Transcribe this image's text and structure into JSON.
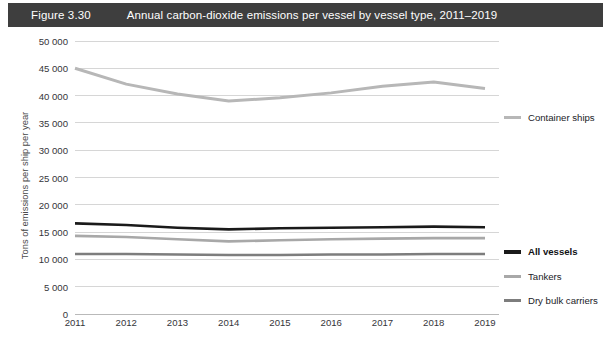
{
  "banner": {
    "figure_number": "Figure 3.30",
    "title": "Annual carbon-dioxide emissions per vessel by vessel type, 2011–2019",
    "background_color": "#3e3e3e",
    "text_color": "#ffffff"
  },
  "legend": {
    "position": "right",
    "entries": [
      {
        "label": "Container ships",
        "color": "#b7b7b7",
        "bold": false,
        "top": 84
      },
      {
        "label": "All vessels",
        "color": "#1a1a1a",
        "bold": true,
        "top": 218
      },
      {
        "label": "Tankers",
        "color": "#a8a8a8",
        "bold": false,
        "top": 243
      },
      {
        "label": "Dry bulk carriers",
        "color": "#7d7d7d",
        "bold": false,
        "top": 267
      }
    ]
  },
  "chart_data": {
    "type": "line",
    "title": "Annual carbon-dioxide emissions per vessel by vessel type, 2011–2019",
    "xlabel": "",
    "ylabel": "Tons of emissions per ship per year",
    "x": [
      "2011",
      "2012",
      "2013",
      "2014",
      "2015",
      "2016",
      "2017",
      "2018",
      "2019"
    ],
    "categories": [
      "2011",
      "2012",
      "2013",
      "2014",
      "2015",
      "2016",
      "2017",
      "2018",
      "2019"
    ],
    "ylim": [
      0,
      50000
    ],
    "yticks": [
      0,
      5000,
      10000,
      15000,
      20000,
      25000,
      30000,
      35000,
      40000,
      45000,
      50000
    ],
    "ytick_labels": [
      "0",
      "5 000",
      "10 000",
      "15 000",
      "20 000",
      "25 000",
      "30 000",
      "35 000",
      "40 000",
      "45 000",
      "50 000"
    ],
    "grid": true,
    "grid_axis": "y",
    "legend_position": "right",
    "series": [
      {
        "name": "Container ships",
        "color": "#b7b7b7",
        "width": 3.0,
        "values": [
          45000,
          42100,
          40300,
          39000,
          39600,
          40500,
          41700,
          42500,
          41300
        ]
      },
      {
        "name": "All vessels",
        "color": "#1a1a1a",
        "width": 2.6,
        "values": [
          16600,
          16300,
          15800,
          15500,
          15700,
          15800,
          15900,
          16000,
          15900
        ]
      },
      {
        "name": "Tankers",
        "color": "#a8a8a8",
        "width": 2.6,
        "values": [
          14300,
          14100,
          13700,
          13300,
          13500,
          13700,
          13800,
          13900,
          13900
        ]
      },
      {
        "name": "Dry bulk carriers",
        "color": "#7d7d7d",
        "width": 2.6,
        "values": [
          11000,
          11000,
          10900,
          10800,
          10800,
          10900,
          10900,
          11000,
          11000
        ]
      }
    ]
  }
}
